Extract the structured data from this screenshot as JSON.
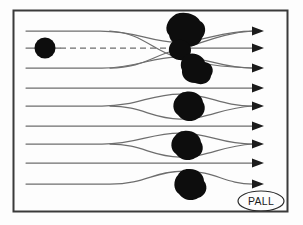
{
  "figure": {
    "background_color": "#fdfdfd",
    "frame": {
      "stroke_color": "#3a3a3a",
      "x": 13,
      "y": 10,
      "width": 275,
      "height": 202
    },
    "stream_color": "#6e6e6e",
    "particle_color": "#0d0d0d",
    "arrow_color": "#1b1b1b"
  },
  "logo": {
    "text": "PALL",
    "shape": "ellipse",
    "stroke_color": "#2b2b2b",
    "cx": 261,
    "cy": 201,
    "rx": 23,
    "ry": 10
  },
  "flow": {
    "direction": "left-to-right",
    "streamline_count": 9,
    "arrow_count": 9,
    "inlet_particle": {
      "cx": 45,
      "cy": 48,
      "r": 10,
      "label": "incoming-particle"
    },
    "dashed_trajectory": {
      "label": "particle-trajectory",
      "y": 48,
      "x_start": 58,
      "x_end": 170
    },
    "streamlines": [
      {
        "id": 1,
        "y_in": 31,
        "y_out": 31,
        "path": "M 26,31 L 100,31 C 140,31 150,41 175,41 C 205,41 215,31 252,31"
      },
      {
        "id": 2,
        "y_in": 48,
        "y_out": 48,
        "path": "M 26,48 L 252,48"
      },
      {
        "id": 3,
        "y_in": 68,
        "y_out": 68,
        "path": "M 26,68 L 102,68 C 140,68 150,57 178,57 C 208,57 216,68 252,68"
      },
      {
        "id": 4,
        "y_in": 88,
        "y_out": 88,
        "path": "M 26,88 L 252,88"
      },
      {
        "id": 5,
        "y_in": 106,
        "y_out": 106,
        "path": "M 26,106 L 102,106 C 140,106 150,94 180,94 C 210,94 216,106 252,106"
      },
      {
        "id": 6,
        "y_in": 126,
        "y_out": 126,
        "path": "M 26,126 L 252,126"
      },
      {
        "id": 7,
        "y_in": 144,
        "y_out": 144,
        "path": "M 26,144 L 102,144 C 140,144 150,133 180,133 C 210,133 216,144 252,144"
      },
      {
        "id": 8,
        "y_in": 163,
        "y_out": 163,
        "path": "M 26,163 L 252,163"
      },
      {
        "id": 9,
        "y_in": 184,
        "y_out": 184,
        "path": "M 26,184 L 110,184 C 145,184 152,172 182,172 C 215,172 222,184 252,184"
      }
    ],
    "extra_streamlines": [
      {
        "id": "1b",
        "path": "M 118,68 C 150,68 152,55 178,50 C 205,45 218,33 252,31"
      },
      {
        "id": "3b",
        "path": "M 118,31 C 150,34 152,52 178,58 C 205,64 218,66 252,68"
      },
      {
        "id": "5b",
        "path": "M 118,106 C 150,106 152,118 180,118 C 210,118 218,108 252,106"
      },
      {
        "id": "7b",
        "path": "M 118,144 C 150,144 152,156 180,156 C 210,156 218,146 252,144"
      }
    ],
    "arrow_tip_x": 262
  },
  "obstacles": [
    {
      "name": "particle-cluster-top-large",
      "cx": 185,
      "cy": 30,
      "r": 17
    },
    {
      "name": "particle-cluster-top-small",
      "cx": 180,
      "cy": 49,
      "r": 9
    },
    {
      "name": "particle-cluster-top-lower",
      "cx": 193,
      "cy": 67,
      "r": 15
    },
    {
      "name": "particle-blob-second-bank",
      "cx": 188,
      "cy": 107,
      "r": 15
    },
    {
      "name": "particle-blob-third-bank",
      "cx": 186,
      "cy": 146,
      "r": 14
    },
    {
      "name": "particle-blob-bottom-bank",
      "cx": 190,
      "cy": 185,
      "r": 15
    }
  ]
}
